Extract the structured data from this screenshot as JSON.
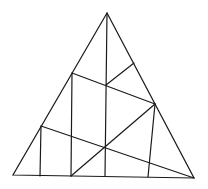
{
  "figure": {
    "stroke_color": "#1a1a1a",
    "background_color": "#ffffff",
    "vertices": {
      "apex": [
        107,
        13
      ],
      "bottom_left": [
        13,
        175
      ],
      "bottom_right": [
        194,
        178
      ]
    },
    "segments": [
      {
        "name": "center-vertical-line",
        "from": [
          107,
          13
        ],
        "to": [
          105,
          176
        ]
      },
      {
        "name": "upper-transversal-line",
        "from": [
          72,
          73
        ],
        "to": [
          155,
          104
        ]
      },
      {
        "name": "upper-right-short-line",
        "from": [
          106,
          85
        ],
        "to": [
          134,
          63
        ]
      },
      {
        "name": "left-inner-vertical-line",
        "from": [
          72,
          73
        ],
        "to": [
          71,
          176
        ]
      },
      {
        "name": "lower-transversal-line",
        "from": [
          41,
          126
        ],
        "to": [
          194,
          178
        ]
      },
      {
        "name": "far-left-vertical-line",
        "from": [
          41,
          126
        ],
        "to": [
          40,
          176
        ]
      },
      {
        "name": "diagonal-line",
        "from": [
          155,
          104
        ],
        "to": [
          71,
          176
        ]
      },
      {
        "name": "right-inner-vertical-line",
        "from": [
          155,
          104
        ],
        "to": [
          148,
          177
        ]
      }
    ]
  }
}
